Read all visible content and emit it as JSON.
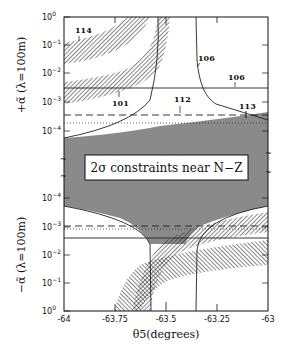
{
  "chart_data": {
    "type": "area",
    "title": "",
    "inset_label": "2σ constraints near N−Z",
    "xlabel": "θ5(degrees)",
    "x_ticks": [
      "-64",
      "-63.75",
      "-63.5",
      "-63.25",
      "-63"
    ],
    "xlim": [
      -64,
      -63
    ],
    "panels": [
      {
        "name": "upper",
        "ylabel": "+α̃ (λ=100m)",
        "ylabel_sign": "+",
        "y_scale": "log",
        "y_ticks": [
          "10^0",
          "10^-1",
          "10^-2",
          "10^-3",
          "10^-4"
        ],
        "ylim": [
          0.0001,
          1
        ],
        "annotations": [
          {
            "label": "114",
            "x": -63.88,
            "y": 0.08
          },
          {
            "label": "101",
            "x": -63.7,
            "y": 0.0012
          },
          {
            "label": "106",
            "x": -63.43,
            "y": 0.02,
            "note": "curve"
          },
          {
            "label": "106",
            "x": -63.13,
            "y": 0.005,
            "note": "horizontal line"
          },
          {
            "label": "112",
            "x": -63.47,
            "y": 0.00035
          },
          {
            "label": "113",
            "x": -63.09,
            "y": 0.0002
          }
        ],
        "lines": [
          {
            "id": "106-horizontal",
            "style": "solid",
            "y": 0.0028
          },
          {
            "id": "112",
            "style": "dashed",
            "y": 0.0004
          },
          {
            "id": "dotted",
            "style": "dotted",
            "y": 0.00016
          }
        ]
      },
      {
        "name": "lower",
        "ylabel": "−α̃ (λ=100m)",
        "ylabel_sign": "−",
        "y_scale": "log",
        "y_ticks": [
          "10^-4",
          "10^-3",
          "10^-2",
          "10^-1",
          "10^0"
        ],
        "ylim": [
          0.0001,
          1
        ],
        "lines": [
          {
            "style": "dashed",
            "y": 0.0009
          },
          {
            "style": "dotted",
            "y": 0.0011
          },
          {
            "style": "solid",
            "y": 0.0024
          }
        ]
      }
    ],
    "shaded_region": "gray allowed region near α̃=0 (between panels)",
    "legend": []
  }
}
